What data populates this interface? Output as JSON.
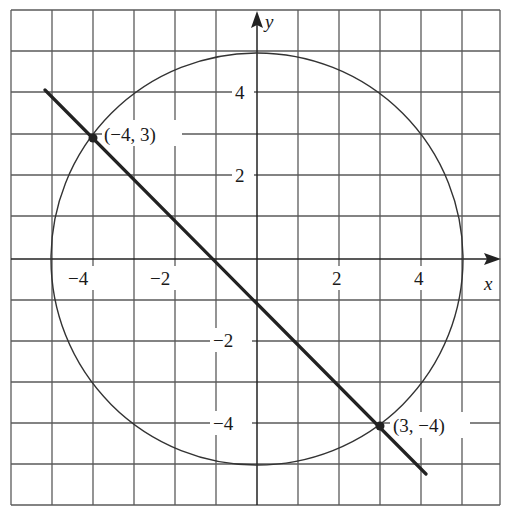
{
  "figure": {
    "grid": {
      "xmin": -6,
      "xmax": 6,
      "ymin": -6,
      "ymax": 6,
      "step": 1
    },
    "axes": {
      "x_label": "x",
      "y_label": "y",
      "x_ticks": [
        {
          "value": -4,
          "label": "−4"
        },
        {
          "value": -2,
          "label": "−2"
        },
        {
          "value": 2,
          "label": "2"
        },
        {
          "value": 4,
          "label": "4"
        }
      ],
      "y_ticks": [
        {
          "value": 4,
          "label": "4"
        },
        {
          "value": 2,
          "label": "2"
        },
        {
          "value": -2,
          "label": "−2"
        },
        {
          "value": -4,
          "label": "−4"
        }
      ]
    },
    "circle": {
      "center": [
        0,
        0
      ],
      "radius": 5
    },
    "line": {
      "from": [
        -5.2,
        4.1
      ],
      "to": [
        4.1,
        -5.2
      ]
    },
    "points": [
      {
        "x": -4,
        "y": 3,
        "label": "(−4, 3)"
      },
      {
        "x": 3,
        "y": -4,
        "label": "(3, −4)"
      }
    ],
    "colors": {
      "grid": "#555555",
      "curve": "#333333",
      "line": "#222222",
      "text": "#1a1a1a"
    }
  },
  "labels": {
    "x_axis": "x",
    "y_axis": "y",
    "tick_x_m4": "−4",
    "tick_x_m2": "−2",
    "tick_x_2": "2",
    "tick_x_4": "4",
    "tick_y_4": "4",
    "tick_y_2": "2",
    "tick_y_m2": "−2",
    "tick_y_m4": "−4",
    "point_a": "(−4, 3)",
    "point_b": "(3, −4)"
  }
}
